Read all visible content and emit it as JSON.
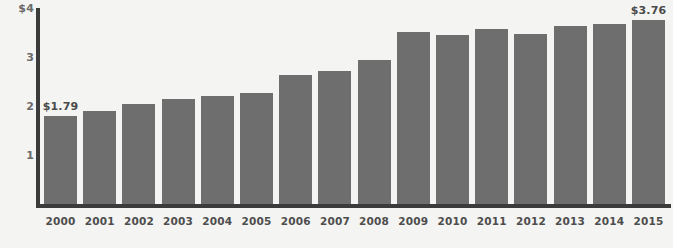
{
  "chart_data": {
    "type": "bar",
    "title": "",
    "subtitle": "",
    "xlabel": "",
    "ylabel": "",
    "ylim": [
      0,
      4
    ],
    "grid": false,
    "legend": null,
    "categories": [
      "2000",
      "2001",
      "2002",
      "2003",
      "2004",
      "2005",
      "2006",
      "2007",
      "2008",
      "2009",
      "2010",
      "2011",
      "2012",
      "2013",
      "2014",
      "2015"
    ],
    "values": [
      1.79,
      1.89,
      2.05,
      2.14,
      2.2,
      2.27,
      2.63,
      2.71,
      2.94,
      3.51,
      3.44,
      3.58,
      3.47,
      3.64,
      3.67,
      3.76
    ],
    "y_ticks": [
      {
        "value": 4,
        "label": "$4"
      },
      {
        "value": 3,
        "label": "3"
      },
      {
        "value": 2,
        "label": "2"
      },
      {
        "value": 1,
        "label": "1"
      }
    ],
    "annotations": [
      {
        "category": "2000",
        "label": "$1.79"
      },
      {
        "category": "2015",
        "label": "$3.76"
      }
    ],
    "colors": {
      "bar": "#6e6e6e",
      "axis": "#3b3b3b",
      "background": "#f4f4f2",
      "y_tick_text": "#6a6a6a",
      "x_tick_text": "#4d4d4d",
      "value_label_text": "#4a4a4a"
    }
  }
}
